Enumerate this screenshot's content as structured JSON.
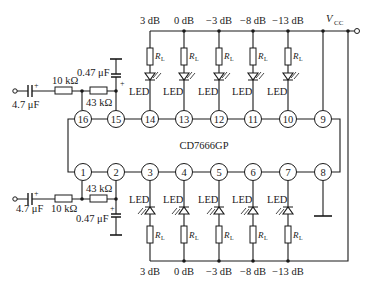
{
  "chip": {
    "label": "CD7666GP"
  },
  "supply": {
    "label": "V",
    "subscript": "CC"
  },
  "pins_top": [
    "16",
    "15",
    "14",
    "13",
    "12",
    "11",
    "10",
    "9"
  ],
  "pins_bottom": [
    "1",
    "2",
    "3",
    "4",
    "5",
    "6",
    "7",
    "8"
  ],
  "channel_levels": [
    "3 dB",
    "0 dB",
    "−3 dB",
    "−8 dB",
    "−13 dB"
  ],
  "top_channel": {
    "levels": [
      "3 dB",
      "0 dB",
      "−3 dB",
      "−8 dB",
      "−13 dB"
    ],
    "led_label": "LED",
    "resistor_label": "R",
    "resistor_sub": "L"
  },
  "bottom_channel": {
    "levels": [
      "3 dB",
      "0 dB",
      "−3 dB",
      "−8 dB",
      "−13 dB"
    ],
    "led_label": "LED",
    "resistor_label": "R",
    "resistor_sub": "L"
  },
  "input_top": {
    "coupling_cap": "4.7 μF",
    "series_resistor": "10 kΩ",
    "feedback_resistor": "43 kΩ",
    "filter_cap": "0.47 μF"
  },
  "input_bottom": {
    "coupling_cap": "4.7 μF",
    "series_resistor": "10 kΩ",
    "feedback_resistor": "43 kΩ",
    "filter_cap": "0.47 μF"
  },
  "polarity_mark": "+"
}
